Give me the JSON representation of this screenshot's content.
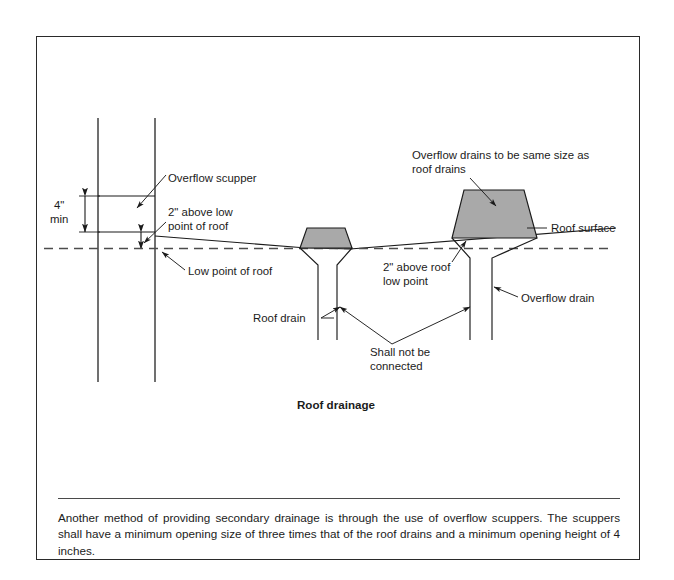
{
  "figure": {
    "title": "Roof drainage",
    "labels": {
      "overflow_scupper": "Overflow scupper",
      "dim_4in": "4\"",
      "dim_min": "min",
      "two_above_low_point_line1": "2\" above low",
      "two_above_low_point_line2": "point of roof",
      "low_point_of_roof": "Low point of roof",
      "roof_drain": "Roof drain",
      "overflow_drains_line1": "Overflow drains to be same size as",
      "overflow_drains_line2": "roof drains",
      "roof_surface": "Roof surface",
      "two_above_roof_line1": "2\" above roof",
      "two_above_roof_line2": "low point",
      "overflow_drain": "Overflow drain",
      "shall_not_be_line1": "Shall not be",
      "shall_not_be_line2": "connected"
    },
    "colors": {
      "dome_fill": "#a9a9a9",
      "line": "#1b1b1b",
      "border": "#2a2a2a",
      "dashed_line": "#4d4d4d"
    }
  },
  "caption": {
    "text": "Another method of providing secondary drainage is through the use of overflow scuppers. The scuppers shall have a minimum opening size of three times that of the roof drains and a minimum opening height of 4 inches."
  }
}
